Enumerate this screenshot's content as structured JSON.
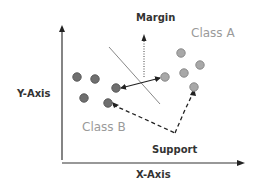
{
  "labels": {
    "y_axis": "Y-Axis",
    "x_axis": "X-Axis",
    "margin": "Margin",
    "support": "Support",
    "class_a": "Class A",
    "class_b": "Class B"
  },
  "colors": {
    "axis": "#333333",
    "class_a_point": "#a8a8a8",
    "class_b_point": "#707070",
    "hyperplane": "#888888",
    "arrow": "#222222",
    "class_label": "#9a9a9a"
  },
  "class_a_points": [
    {
      "x": 181,
      "y": 53
    },
    {
      "x": 200,
      "y": 65
    },
    {
      "x": 184,
      "y": 73
    },
    {
      "x": 165,
      "y": 77
    },
    {
      "x": 194,
      "y": 87
    }
  ],
  "class_b_points": [
    {
      "x": 77,
      "y": 77
    },
    {
      "x": 95,
      "y": 79
    },
    {
      "x": 116,
      "y": 88
    },
    {
      "x": 84,
      "y": 93
    },
    {
      "x": 108,
      "y": 103
    }
  ]
}
